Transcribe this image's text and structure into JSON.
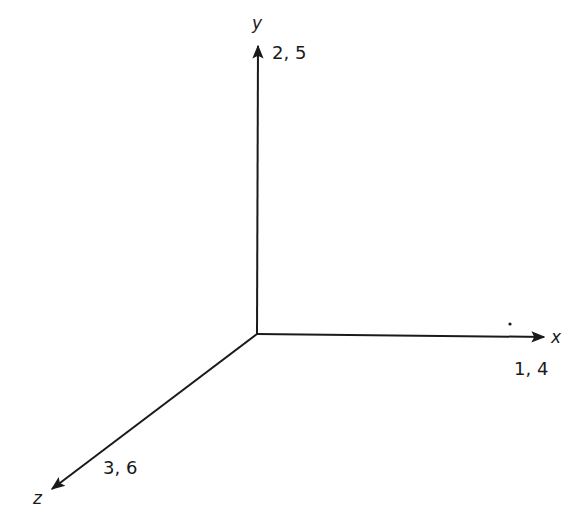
{
  "diagram": {
    "title": "",
    "type": "3d-coordinate-axes",
    "origin": {
      "x": 257,
      "y": 334
    },
    "axes": [
      {
        "name": "x",
        "label": "x",
        "indices": "1, 4",
        "end": {
          "x": 547,
          "y": 337
        }
      },
      {
        "name": "y",
        "label": "y",
        "indices": "2, 5",
        "end": {
          "x": 258,
          "y": 42
        }
      },
      {
        "name": "z",
        "label": "z",
        "indices": "3, 6",
        "end": {
          "x": 48,
          "y": 492
        }
      }
    ],
    "colors": {
      "line": "#1a1a1a",
      "background": "#ffffff"
    }
  }
}
